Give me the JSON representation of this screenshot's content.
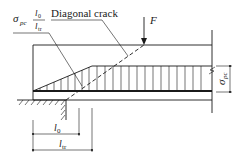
{
  "diagram": {
    "title": "",
    "labels": {
      "stress_symbol": "σ",
      "stress_subscript": "pc",
      "fraction_numerator": "l",
      "fraction_numerator_sub": "0",
      "fraction_denominator": "l",
      "fraction_denominator_sub": "tr",
      "crack_label": "Diagonal crack",
      "force_label": "F",
      "right_dim_symbol": "σ",
      "right_dim_sub": "pc",
      "dim_l0": "l",
      "dim_l0_sub": "0",
      "dim_ltr": "l",
      "dim_ltr_sub": "tr"
    },
    "elements": {
      "beam": "prestressed beam end",
      "support": "hatched end support",
      "stress_diagram": "hatched stress distribution (linear ramp over transfer length, constant thereafter)",
      "crack": "dashed diagonal crack from support edge to load point",
      "load": "point load F"
    },
    "colors": {
      "line": "#1a1a1a",
      "background": "#ffffff"
    }
  }
}
